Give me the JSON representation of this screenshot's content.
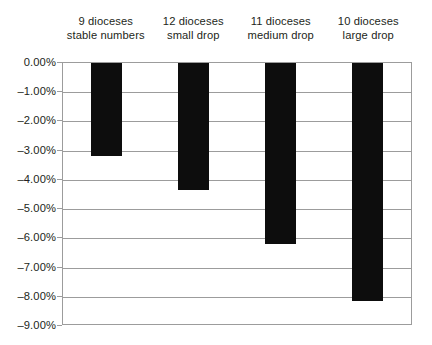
{
  "chart_data": {
    "type": "bar",
    "title": "",
    "subtitle": "",
    "xlabel": "",
    "ylabel": "",
    "categories": [
      "9 dioceses stable numbers",
      "12 dioceses small drop",
      "11 dioceses medium drop",
      "10 dioceses large drop"
    ],
    "category_lines": [
      [
        "9 dioceses",
        "stable numbers"
      ],
      [
        "12 dioceses",
        "small drop"
      ],
      [
        "11 dioceses",
        "medium drop"
      ],
      [
        "10 dioceses",
        "large drop"
      ]
    ],
    "values": [
      -3.19,
      -4.35,
      -6.2,
      -8.15
    ],
    "ylim": [
      -9.0,
      0.0
    ],
    "y_ticks": [
      0.0,
      -1.0,
      -2.0,
      -3.0,
      -4.0,
      -5.0,
      -6.0,
      -7.0,
      -8.0,
      -9.0
    ],
    "y_tick_labels": [
      "0.00%",
      "–1.00%",
      "–2.00%",
      "–3.00%",
      "–4.00%",
      "–5.00%",
      "–6.00%",
      "–7.00%",
      "–8.00%",
      "–9.00%"
    ],
    "grid": true,
    "legend": false,
    "legend_position": "none",
    "bar_color": "#0d0d0d",
    "grid_color": "#9c9c9c",
    "text_color": "#231f20",
    "background_color": "#ffffff",
    "labels_position": "top"
  }
}
